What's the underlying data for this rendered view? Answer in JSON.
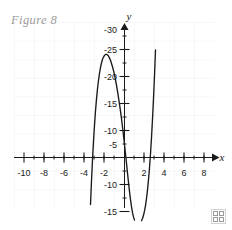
{
  "figure": {
    "caption": "Figure 8",
    "corner_mark_name": "grid-logo-watermark"
  },
  "colors": {
    "curve": "#1a1a1a",
    "axis": "#1a1a1a",
    "grid": "#eef0f2",
    "caption": "#9b9b9b",
    "background": "#ffffff"
  },
  "chart_data": {
    "type": "line",
    "title": "Figure 8",
    "xlabel": "x",
    "ylabel": "y",
    "grid": true,
    "legend": "none",
    "xlim": [
      -10.8,
      9.2
    ],
    "ylim": [
      -16.5,
      31.5
    ],
    "xticks": [
      -10,
      -8,
      -6,
      -4,
      -2,
      2,
      4,
      6,
      8
    ],
    "xtick_labels": [
      "-10",
      "-8",
      "-6",
      "-4",
      "-2",
      "2",
      "4",
      "6",
      "8"
    ],
    "yticks": [
      -15,
      -10,
      -5,
      5,
      10,
      15,
      20,
      25,
      30
    ],
    "ytick_labels": [
      "-15",
      "-10",
      "-5",
      "-5",
      "-10",
      "-15",
      "-20",
      "-25",
      "-30"
    ],
    "xtick_minor_step": 1,
    "ytick_minor_step": 2.5,
    "series": [
      {
        "name": "quartic curve",
        "x": [
          -3.55,
          -3.5,
          -3.4,
          -3.3,
          -3.2,
          -3.1,
          -3.0,
          -2.9,
          -2.8,
          -2.7,
          -2.6,
          -2.5,
          -2.4,
          -2.3,
          -2.2,
          -2.1,
          -2.0,
          -1.9,
          -1.8,
          -1.7,
          -1.6,
          -1.5,
          -1.4,
          -1.3,
          -1.2,
          -1.1,
          -1.0,
          -0.9,
          -0.8,
          -0.7,
          -0.6,
          -0.5,
          -0.4,
          -0.3,
          -0.2,
          -0.1,
          0.0,
          0.1,
          0.2,
          0.3,
          0.4,
          0.5,
          0.6,
          0.7,
          0.8,
          0.9,
          1.0,
          1.1,
          1.2,
          1.3,
          1.4,
          1.5,
          1.6,
          1.7,
          1.8,
          1.9,
          2.0,
          2.1,
          2.2,
          2.3,
          2.4,
          2.5,
          2.6,
          2.7,
          2.8,
          2.9,
          3.0,
          3.1,
          3.2,
          3.3,
          3.4,
          3.5,
          3.6,
          3.62
        ],
        "y": [
          -16.3,
          -13.6,
          -8.7,
          -4.3,
          -0.4,
          3.0,
          6.0,
          8.6,
          10.8,
          12.7,
          14.3,
          15.6,
          16.7,
          17.5,
          18.2,
          18.6,
          18.9,
          19.1,
          19.1,
          19.0,
          18.8,
          18.4,
          18.0,
          17.4,
          16.8,
          16.1,
          15.3,
          14.4,
          13.4,
          12.3,
          11.1,
          9.9,
          8.6,
          7.2,
          5.7,
          4.1,
          2.4,
          0.7,
          -1.1,
          -2.9,
          -4.6,
          -6.3,
          -7.8,
          -9.1,
          -10.2,
          -11.0,
          -11.6,
          -12.0,
          -12.2,
          -12.3,
          -12.3,
          -12.2,
          -12.0,
          -11.7,
          -11.3,
          -10.7,
          -9.9,
          -8.9,
          -7.6,
          -6.0,
          -4.1,
          -1.9,
          0.7,
          3.7,
          7.1,
          10.9,
          15.2,
          19.9,
          25.1,
          30.8,
          36.9,
          43.5,
          50.6,
          52.1
        ]
      }
    ],
    "features": {
      "local_max": {
        "x": -1.85,
        "y": 19.1
      },
      "local_min": {
        "x": 1.35,
        "y": -12.3
      },
      "x_intercepts": [
        -3.2,
        0.14,
        2.75
      ]
    }
  },
  "axes": {
    "x_axis_label": "x",
    "y_axis_label": "y"
  }
}
